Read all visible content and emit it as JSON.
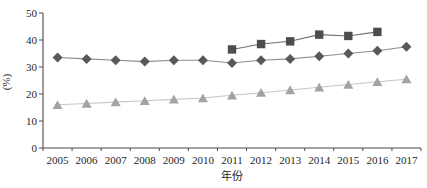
{
  "chart_data": {
    "type": "line",
    "title": "",
    "xlabel": "年份",
    "ylabel": "(%)",
    "ylim": [
      0,
      50
    ],
    "yticks": [
      0,
      10,
      20,
      30,
      40,
      50
    ],
    "grid": false,
    "legend": "none",
    "categories": [
      "2005",
      "2006",
      "2007",
      "2008",
      "2009",
      "2010",
      "2011",
      "2012",
      "2013",
      "2014",
      "2015",
      "2016",
      "2017"
    ],
    "series": [
      {
        "name": "square-series",
        "marker": "square",
        "marker_color": "#4d4d4d",
        "line_color": "#6e6e6e",
        "values": [
          null,
          null,
          null,
          null,
          null,
          null,
          36.5,
          38.5,
          39.5,
          42,
          41.5,
          43,
          null
        ]
      },
      {
        "name": "diamond-series",
        "marker": "diamond",
        "marker_color": "#595959",
        "line_color": "#8c8c8c",
        "values": [
          33.5,
          33,
          32.5,
          32,
          32.5,
          32.5,
          31.5,
          32.5,
          33,
          34,
          35,
          36,
          37.5
        ]
      },
      {
        "name": "triangle-series",
        "marker": "triangle",
        "marker_color": "#a3a3a3",
        "line_color": "#c6c6c6",
        "values": [
          16,
          16.5,
          17,
          17.5,
          18,
          18.5,
          19.5,
          20.5,
          21.5,
          22.5,
          23.5,
          24.5,
          25.5
        ]
      }
    ],
    "axis_color": "#4a4a4a"
  }
}
